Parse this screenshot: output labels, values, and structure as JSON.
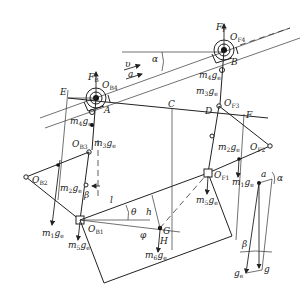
{
  "diagram": {
    "type": "free-body mechanism diagram on incline",
    "incline_angle_label": "α",
    "motion": {
      "velocity": "υ",
      "acceleration": "a"
    },
    "points": {
      "E": "E",
      "A": "A",
      "B": "B",
      "C": "C",
      "D": "D",
      "F": "F",
      "G": "G",
      "H": "H"
    },
    "joints": {
      "OB4": {
        "main": "O",
        "sub": "B4"
      },
      "OF4": {
        "main": "O",
        "sub": "F4"
      },
      "OB3": {
        "main": "O",
        "sub": "B3"
      },
      "OF3": {
        "main": "O",
        "sub": "F3"
      },
      "OB2": {
        "main": "O",
        "sub": "B2"
      },
      "OF2": {
        "main": "O",
        "sub": "F2"
      },
      "OB1": {
        "main": "O",
        "sub": "B1"
      },
      "OF1": {
        "main": "O",
        "sub": "F1"
      }
    },
    "forces": {
      "FB": {
        "main": "F",
        "sub": "B"
      },
      "FF": {
        "main": "F",
        "sub": "F"
      },
      "m4ge_left": {
        "main": "m",
        "sub": "4",
        "rest": "g",
        "rest_sub": "e"
      },
      "m3ge_left": {
        "main": "m",
        "sub": "3",
        "rest": "g",
        "rest_sub": "e"
      },
      "m2ge_left": {
        "main": "m",
        "sub": "2",
        "rest": "g",
        "rest_sub": "e"
      },
      "m1ge_left": {
        "main": "m",
        "sub": "1",
        "rest": "g",
        "rest_sub": "e"
      },
      "m5ge_left": {
        "main": "m",
        "sub": "5",
        "rest": "g",
        "rest_sub": "e"
      },
      "m4ge_right": {
        "main": "m",
        "sub": "4",
        "rest": "g",
        "rest_sub": "e"
      },
      "m3ge_right": {
        "main": "m",
        "sub": "3",
        "rest": "g",
        "rest_sub": "e"
      },
      "m2ge_right": {
        "main": "m",
        "sub": "2",
        "rest": "g",
        "rest_sub": "e"
      },
      "m1ge_right": {
        "main": "m",
        "sub": "1",
        "rest": "g",
        "rest_sub": "e"
      },
      "m5ge_right": {
        "main": "m",
        "sub": "5",
        "rest": "g",
        "rest_sub": "e"
      },
      "m6ge": {
        "main": "m",
        "sub": "6",
        "rest": "g",
        "rest_sub": "e"
      }
    },
    "dimensions": {
      "l": "l",
      "h": "h",
      "theta": "θ",
      "phi": "φ",
      "beta": "β"
    },
    "vector_triangle": {
      "a": "a",
      "alpha": "α",
      "beta": "β",
      "g": "g",
      "ge_main": "g",
      "ge_sub": "e"
    }
  }
}
